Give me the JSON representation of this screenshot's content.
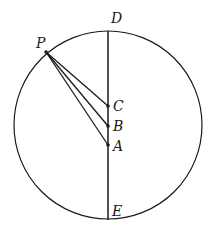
{
  "diagram": {
    "type": "geometry",
    "circle": {
      "cx": 108,
      "cy": 125,
      "r": 94
    },
    "diameter": {
      "from": "D",
      "to": "E"
    },
    "points": {
      "P": {
        "label": "P",
        "x": 46,
        "y": 52
      },
      "D": {
        "label": "D",
        "x": 108,
        "y": 31
      },
      "E": {
        "label": "E",
        "x": 108,
        "y": 219
      },
      "C": {
        "label": "C",
        "x": 108,
        "y": 106
      },
      "B": {
        "label": "B",
        "x": 108,
        "y": 126
      },
      "A": {
        "label": "A",
        "x": 108,
        "y": 145
      }
    },
    "segments": [
      [
        "P",
        "C"
      ],
      [
        "P",
        "B"
      ],
      [
        "P",
        "A"
      ],
      [
        "D",
        "E"
      ]
    ],
    "labels": {
      "P": "P",
      "D": "D",
      "C": "C",
      "B": "B",
      "A": "A",
      "E": "E"
    },
    "stroke_color": "#1a1a1a"
  }
}
